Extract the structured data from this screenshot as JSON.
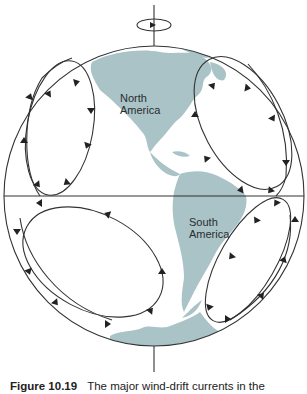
{
  "figure": {
    "labels": {
      "north_america": [
        "North",
        "America"
      ],
      "south_america": [
        "South",
        "America"
      ]
    },
    "caption": {
      "number": "Figure 10.19",
      "text": "The major wind-drift currents in the"
    },
    "colors": {
      "land": "#a9c3c6",
      "outline": "#333333",
      "background": "#ffffff"
    },
    "gyres": [
      {
        "name": "North Pacific gyre",
        "rotation": "clockwise"
      },
      {
        "name": "North Atlantic gyre",
        "rotation": "clockwise"
      },
      {
        "name": "South Pacific gyre",
        "rotation": "counterclockwise"
      },
      {
        "name": "South Atlantic gyre",
        "rotation": "counterclockwise"
      }
    ],
    "rotation_axis": {
      "indicator": "rotation-arrow",
      "direction": "eastward"
    }
  }
}
